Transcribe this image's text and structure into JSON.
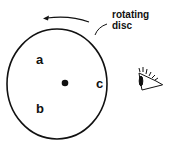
{
  "diagram": {
    "title_label": "rotating disc",
    "title_lines": [
      "rotating",
      "disc"
    ],
    "points": [
      {
        "id": "a",
        "label": "a"
      },
      {
        "id": "b",
        "label": "b"
      },
      {
        "id": "c",
        "label": "c"
      }
    ],
    "center_marker": "center-dot",
    "rotation_direction": "counterclockwise",
    "observer": "eye-icon",
    "colors": {
      "stroke": "#111111",
      "background": "#ffffff"
    }
  }
}
